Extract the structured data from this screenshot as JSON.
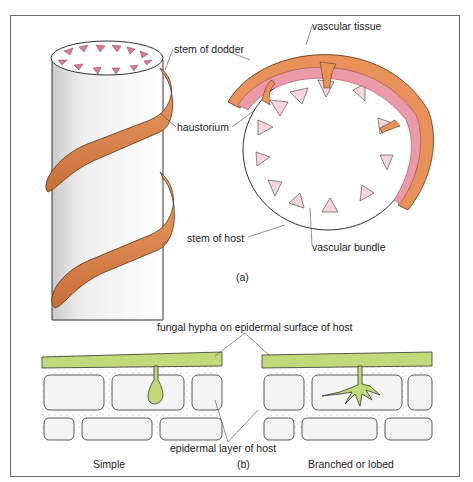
{
  "figure": {
    "part_a": {
      "caption": "(a)",
      "labels": {
        "stem_of_dodder": "stem of dodder",
        "haustorium": "haustorium",
        "stem_of_host": "stem of host",
        "vascular_tissue": "vascular tissue",
        "vascular_bundle": "vascular bundle"
      }
    },
    "part_b": {
      "caption": "(b)",
      "labels": {
        "fungal_hypha": "fungal hypha on epidermal surface of host",
        "epidermal_layer": "epidermal layer of host",
        "simple": "Simple",
        "branched": "Branched or lobed"
      }
    },
    "colors": {
      "dodder_orange": "#e8925a",
      "vascular_pink": "#ec9aa8",
      "bundle_pink": "#f6d6dc",
      "hypha_green": "#c2d97a",
      "outline": "#333333"
    }
  }
}
